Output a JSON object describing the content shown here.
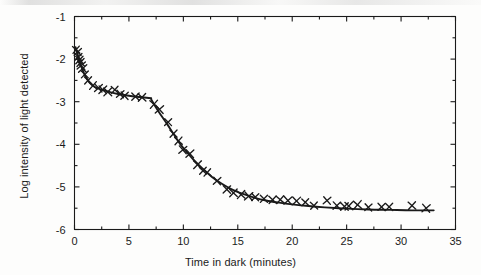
{
  "chart_data": {
    "type": "scatter",
    "title": "",
    "xlabel": "Time in dark (minutes)",
    "ylabel": "Log intensity of light detected",
    "xlim": [
      0,
      35
    ],
    "ylim": [
      -6,
      -1
    ],
    "xticks": [
      0,
      5,
      10,
      15,
      20,
      25,
      30,
      35
    ],
    "xtick_labels": [
      "0",
      "5",
      "10",
      "15",
      "20",
      "25",
      "30",
      "35"
    ],
    "yticks": [
      -1,
      -2,
      -3,
      -4,
      -5,
      -6
    ],
    "ytick_labels": [
      "-1",
      "-2",
      "-3",
      "-4",
      "-5",
      "-6"
    ],
    "grid": false,
    "legend": null,
    "minor_ticks_x_interval": 2.5,
    "minor_ticks_y_interval": 0.5,
    "frame": "box-all-sides-inward-ticks",
    "marker": "x",
    "marker_color": "#1a1a1a",
    "line_color": "#1a1a1a",
    "annotation": "Two-branch dark adaptation curve with cone-rod (Kohlrausch) break near 7 minutes",
    "series": [
      {
        "name": "Measured threshold",
        "marker": "x",
        "points": [
          [
            0.15,
            -1.78
          ],
          [
            0.3,
            -1.83
          ],
          [
            0.35,
            -1.95
          ],
          [
            0.45,
            -2.02
          ],
          [
            0.55,
            -2.08
          ],
          [
            0.62,
            -2.15
          ],
          [
            0.75,
            -2.22
          ],
          [
            0.95,
            -2.36
          ],
          [
            1.25,
            -2.5
          ],
          [
            1.7,
            -2.62
          ],
          [
            2.2,
            -2.68
          ],
          [
            2.6,
            -2.72
          ],
          [
            3.05,
            -2.77
          ],
          [
            3.7,
            -2.72
          ],
          [
            4.2,
            -2.82
          ],
          [
            4.6,
            -2.86
          ],
          [
            5.6,
            -2.88
          ],
          [
            6.2,
            -2.9
          ],
          [
            7.3,
            -3.06
          ],
          [
            7.8,
            -3.18
          ],
          [
            8.6,
            -3.48
          ],
          [
            9.1,
            -3.75
          ],
          [
            9.55,
            -3.92
          ],
          [
            9.95,
            -4.13
          ],
          [
            10.6,
            -4.22
          ],
          [
            11.3,
            -4.48
          ],
          [
            11.8,
            -4.62
          ],
          [
            12.2,
            -4.66
          ],
          [
            13.1,
            -4.86
          ],
          [
            14.0,
            -5.06
          ],
          [
            14.6,
            -5.14
          ],
          [
            15.3,
            -5.18
          ],
          [
            16.0,
            -5.22
          ],
          [
            16.6,
            -5.24
          ],
          [
            17.4,
            -5.28
          ],
          [
            18.2,
            -5.3
          ],
          [
            18.9,
            -5.3
          ],
          [
            19.6,
            -5.32
          ],
          [
            20.4,
            -5.33
          ],
          [
            21.2,
            -5.36
          ],
          [
            22.0,
            -5.44
          ],
          [
            23.2,
            -5.32
          ],
          [
            24.1,
            -5.44
          ],
          [
            24.8,
            -5.46
          ],
          [
            25.2,
            -5.45
          ],
          [
            26.0,
            -5.42
          ],
          [
            27.0,
            -5.48
          ],
          [
            28.2,
            -5.47
          ],
          [
            28.9,
            -5.47
          ],
          [
            31.0,
            -5.44
          ],
          [
            32.3,
            -5.5
          ]
        ]
      },
      {
        "name": "Fitted cone branch",
        "type": "line",
        "points": [
          [
            0.1,
            -1.72
          ],
          [
            0.3,
            -1.9
          ],
          [
            0.5,
            -2.08
          ],
          [
            0.75,
            -2.26
          ],
          [
            1.0,
            -2.4
          ],
          [
            1.4,
            -2.56
          ],
          [
            1.9,
            -2.66
          ],
          [
            2.5,
            -2.72
          ],
          [
            3.2,
            -2.77
          ],
          [
            4.0,
            -2.82
          ],
          [
            5.0,
            -2.86
          ],
          [
            6.0,
            -2.89
          ],
          [
            7.05,
            -2.92
          ]
        ]
      },
      {
        "name": "Fitted rod branch",
        "type": "line",
        "points": [
          [
            7.05,
            -2.95
          ],
          [
            7.4,
            -3.1
          ],
          [
            7.9,
            -3.3
          ],
          [
            8.5,
            -3.52
          ],
          [
            9.1,
            -3.76
          ],
          [
            9.7,
            -3.99
          ],
          [
            10.3,
            -4.18
          ],
          [
            11.0,
            -4.38
          ],
          [
            11.8,
            -4.58
          ],
          [
            12.6,
            -4.76
          ],
          [
            13.5,
            -4.92
          ],
          [
            14.4,
            -5.05
          ],
          [
            15.4,
            -5.16
          ],
          [
            16.5,
            -5.25
          ],
          [
            17.6,
            -5.32
          ],
          [
            18.8,
            -5.37
          ],
          [
            20.0,
            -5.41
          ],
          [
            21.5,
            -5.45
          ],
          [
            23.0,
            -5.48
          ],
          [
            25.0,
            -5.51
          ],
          [
            27.0,
            -5.53
          ],
          [
            29.0,
            -5.54
          ],
          [
            31.0,
            -5.55
          ],
          [
            33.0,
            -5.55
          ]
        ]
      }
    ]
  }
}
